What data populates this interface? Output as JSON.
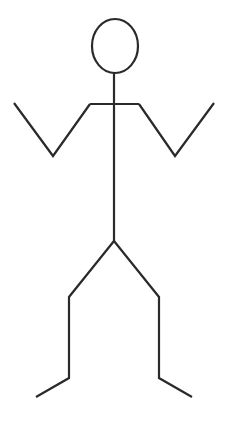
{
  "figure": {
    "type": "stick-figure",
    "stroke_color": "#2a2a2a",
    "stroke_width": 2.2,
    "background": "#ffffff",
    "head": {
      "cx": 115,
      "cy": 46,
      "rx": 23,
      "ry": 27
    },
    "neck": {
      "x1": 114,
      "y1": 73,
      "x2": 114,
      "y2": 104
    },
    "shoulders": {
      "x1": 90,
      "y1": 104,
      "x2": 139,
      "y2": 104
    },
    "spine": {
      "x1": 114,
      "y1": 104,
      "x2": 114,
      "y2": 241
    },
    "left_arm": "90,104 53,156 14,103",
    "right_arm": "139,104 175,156 214,103",
    "left_leg": "114,241 69,297 69,378 36,397",
    "right_leg": "114,241 159,297 159,378 192,397"
  }
}
